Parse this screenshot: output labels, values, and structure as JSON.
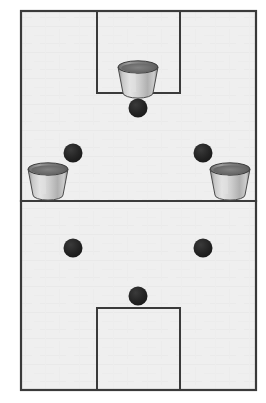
{
  "diagram": {
    "canvas": {
      "width": 266,
      "height": 403,
      "background": "#ffffff"
    },
    "court": {
      "name": "court-outline",
      "x": 21,
      "y": 11,
      "width": 235,
      "height": 379,
      "fill": "#efefef",
      "stroke": "#3a3a3a",
      "stroke_width": 2.2
    },
    "halfway_line": {
      "name": "halfway-line",
      "x1": 21,
      "y1": 201,
      "x2": 256,
      "y2": 201,
      "stroke": "#3a3a3a",
      "stroke_width": 2.2
    },
    "goal_areas": [
      {
        "name": "top-goal-area",
        "x": 97,
        "y": 11,
        "width": 83,
        "height": 82,
        "stroke": "#3a3a3a",
        "stroke_width": 2.0
      },
      {
        "name": "bottom-goal-area",
        "x": 97,
        "y": 308,
        "width": 83,
        "height": 82,
        "stroke": "#3a3a3a",
        "stroke_width": 2.0
      }
    ],
    "buckets": [
      {
        "name": "bucket-top-center",
        "cx": 138,
        "cy": 80,
        "top_width": 40,
        "bottom_width": 30,
        "height": 26,
        "body_color": "#b5b5b5",
        "rim_color": "#6e6e6e",
        "highlight_color": "#e2e2e2"
      },
      {
        "name": "bucket-left-side",
        "cx": 48,
        "cy": 182,
        "top_width": 40,
        "bottom_width": 30,
        "height": 26,
        "body_color": "#b5b5b5",
        "rim_color": "#6e6e6e",
        "highlight_color": "#e2e2e2"
      },
      {
        "name": "bucket-right-side",
        "cx": 230,
        "cy": 182,
        "top_width": 40,
        "bottom_width": 30,
        "height": 26,
        "body_color": "#b5b5b5",
        "rim_color": "#6e6e6e",
        "highlight_color": "#e2e2e2"
      }
    ],
    "balls": [
      {
        "name": "ball-top-center",
        "cx": 138,
        "cy": 108,
        "r": 9.5,
        "color": "#1c1c1c"
      },
      {
        "name": "ball-upper-left",
        "cx": 73,
        "cy": 153,
        "r": 9.5,
        "color": "#1c1c1c"
      },
      {
        "name": "ball-upper-right",
        "cx": 203,
        "cy": 153,
        "r": 9.5,
        "color": "#1c1c1c"
      },
      {
        "name": "ball-lower-left",
        "cx": 73,
        "cy": 248,
        "r": 9.5,
        "color": "#1c1c1c"
      },
      {
        "name": "ball-lower-right",
        "cx": 203,
        "cy": 248,
        "r": 9.5,
        "color": "#1c1c1c"
      },
      {
        "name": "ball-bottom-center",
        "cx": 138,
        "cy": 296,
        "r": 9.5,
        "color": "#1c1c1c"
      }
    ]
  }
}
